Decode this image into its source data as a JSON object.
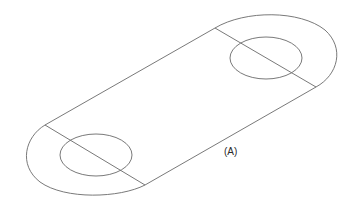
{
  "figure": {
    "label": "(A)",
    "stroke_color": "#6a6a6a"
  }
}
